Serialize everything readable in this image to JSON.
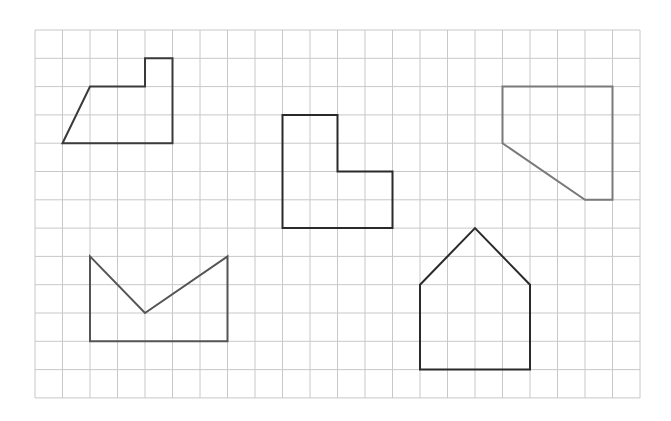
{
  "grid": {
    "origin_x": 35,
    "origin_y": 30,
    "cell_w": 27.5,
    "cell_h": 28.3,
    "cols": 22,
    "rows": 13,
    "line_color": "#c8c8c8"
  },
  "shapes": [
    {
      "name": "shape-top-left-polygon",
      "stroke": "#3a3a3a",
      "width": 2,
      "points": [
        [
          1,
          4
        ],
        [
          2,
          2
        ],
        [
          4,
          2
        ],
        [
          4,
          1
        ],
        [
          5,
          1
        ],
        [
          5,
          4
        ]
      ]
    },
    {
      "name": "shape-l-shape",
      "stroke": "#2a2a2a",
      "width": 2,
      "points": [
        [
          9,
          3
        ],
        [
          11,
          3
        ],
        [
          11,
          5
        ],
        [
          13,
          5
        ],
        [
          13,
          7
        ],
        [
          9,
          7
        ]
      ]
    },
    {
      "name": "shape-top-right-pentagon",
      "stroke": "#7a7a7a",
      "width": 2,
      "points": [
        [
          17,
          2
        ],
        [
          21,
          2
        ],
        [
          21,
          6
        ],
        [
          20,
          6
        ],
        [
          17,
          4
        ]
      ]
    },
    {
      "name": "shape-bottom-left-notched",
      "stroke": "#555555",
      "width": 2,
      "points": [
        [
          2,
          8
        ],
        [
          4,
          10
        ],
        [
          7,
          8
        ],
        [
          7,
          11
        ],
        [
          2,
          11
        ]
      ]
    },
    {
      "name": "shape-house",
      "stroke": "#2a2a2a",
      "width": 2,
      "points": [
        [
          14,
          9
        ],
        [
          16,
          7
        ],
        [
          18,
          9
        ],
        [
          18,
          12
        ],
        [
          14,
          12
        ]
      ]
    }
  ]
}
